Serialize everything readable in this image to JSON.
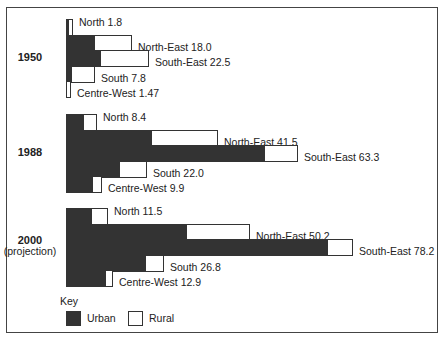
{
  "chart_data": {
    "type": "bar",
    "orientation": "horizontal",
    "stacked": true,
    "title": "",
    "xlabel": "",
    "ylabel": "",
    "grid": false,
    "legend_position": "bottom-left",
    "legend": {
      "title": "Key",
      "entries": [
        {
          "name": "Urban",
          "color": "#333333"
        },
        {
          "name": "Rural",
          "color": "#ffffff"
        }
      ]
    },
    "groups": [
      {
        "label": "1950",
        "sublabel": "",
        "bars": [
          {
            "region": "North",
            "total": 1.8,
            "urban": 0.8,
            "rural": 1.0,
            "label": "North 1.8"
          },
          {
            "region": "North-East",
            "total": 18.0,
            "urban": 7.9,
            "rural": 10.1,
            "label": "North-East 18.0"
          },
          {
            "region": "South-East",
            "total": 22.5,
            "urban": 9.5,
            "rural": 13.0,
            "label": "South-East 22.5"
          },
          {
            "region": "South",
            "total": 7.8,
            "urban": 1.6,
            "rural": 6.2,
            "label": "South 7.8"
          },
          {
            "region": "Centre-West",
            "total": 1.47,
            "urban": 0.4,
            "rural": 1.07,
            "label": "Centre-West 1.47"
          }
        ]
      },
      {
        "label": "1988",
        "sublabel": "",
        "bars": [
          {
            "region": "North",
            "total": 8.4,
            "urban": 4.9,
            "rural": 3.5,
            "label": "North 8.4"
          },
          {
            "region": "North-East",
            "total": 41.5,
            "urban": 23.4,
            "rural": 18.1,
            "label": "North-East 41.5"
          },
          {
            "region": "South-East",
            "total": 63.3,
            "urban": 54.2,
            "rural": 9.1,
            "label": "South-East 63.3"
          },
          {
            "region": "South",
            "total": 22.0,
            "urban": 14.7,
            "rural": 7.3,
            "label": "South 22.0"
          },
          {
            "region": "Centre-West",
            "total": 9.9,
            "urban": 7.4,
            "rural": 2.5,
            "label": "Centre-West 9.9"
          }
        ]
      },
      {
        "label": "2000",
        "sublabel": "(projection)",
        "bars": [
          {
            "region": "North",
            "total": 11.5,
            "urban": 7.1,
            "rural": 4.4,
            "label": "North 11.5"
          },
          {
            "region": "North-East",
            "total": 50.2,
            "urban": 33.0,
            "rural": 17.2,
            "label": "North-East 50.2"
          },
          {
            "region": "South-East",
            "total": 78.2,
            "urban": 71.4,
            "rural": 6.8,
            "label": "South-East 78.2"
          },
          {
            "region": "South",
            "total": 26.8,
            "urban": 21.8,
            "rural": 5.0,
            "label": "South 26.8"
          },
          {
            "region": "Centre-West",
            "total": 12.9,
            "urban": 10.9,
            "rural": 2.0,
            "label": "Centre-West 12.9"
          }
        ]
      }
    ]
  },
  "key": {
    "title": "Key",
    "urban": "Urban",
    "rural": "Rural"
  }
}
